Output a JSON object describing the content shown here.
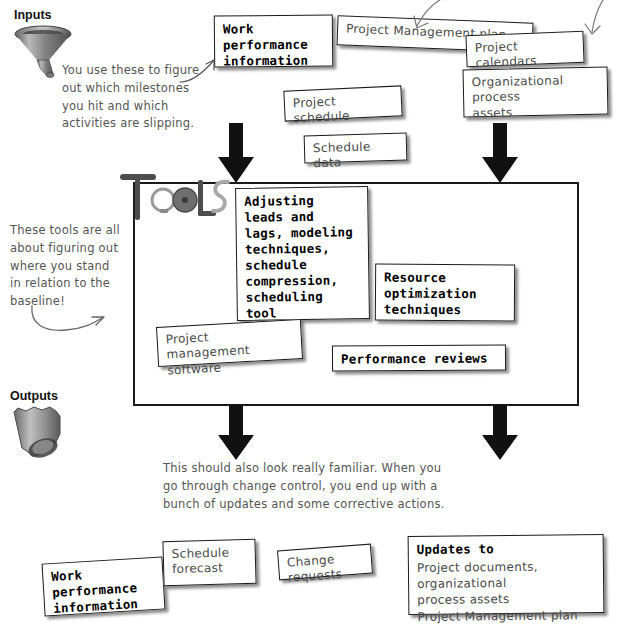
{
  "sections": {
    "inputs_label": "Inputs",
    "outputs_label": "Outputs",
    "tools_wordmark": "Tools"
  },
  "inputs": {
    "note": "You use these to figure\nout which milestones\nyou hit and which\nactivities are slipping.",
    "boxes": [
      {
        "text": "Work\nperformance\ninformation",
        "style": "mono"
      },
      {
        "text": "Project Management plan",
        "style": "hand"
      },
      {
        "text": "Project calendars",
        "style": "hand"
      },
      {
        "text": "Organizational process\nassets",
        "style": "hand"
      },
      {
        "text": "Project schedule",
        "style": "hand"
      },
      {
        "text": "Schedule data",
        "style": "hand"
      }
    ]
  },
  "tools": {
    "note": "These tools are all\nabout figuring out\nwhere you stand\nin relation to the\nbaseline!",
    "boxes": [
      {
        "text": "Adjusting\nleads and\nlags, modeling\ntechniques,\nschedule\ncompression,\nscheduling tool",
        "style": "mono"
      },
      {
        "text": "Resource\noptimization\ntechniques",
        "style": "mono"
      },
      {
        "text": "Project management\nsoftware",
        "style": "hand"
      },
      {
        "text": "Performance reviews",
        "style": "mono"
      }
    ]
  },
  "outputs": {
    "note": "This should also look really familiar. When you\ngo through change control, you end up with a\nbunch of updates and some corrective actions.",
    "boxes": [
      {
        "text": "Work\nperformance\ninformation",
        "style": "mono"
      },
      {
        "text": "Schedule\nforecast",
        "style": "hand"
      },
      {
        "text": "Change requests",
        "style": "hand"
      },
      {
        "text": "Updates to",
        "style": "mono"
      },
      {
        "text": "Project documents, organizational\nprocess assets\nProject Management plan",
        "style": "hand"
      }
    ]
  },
  "icons": {
    "funnel": "funnel-icon",
    "bucket": "bucket-icon",
    "arrow_down": "arrow-down-icon",
    "curved_arrow": "curved-arrow-icon",
    "pointer_arrow": "pointer-arrow-icon"
  },
  "colors": {
    "ink": "#1a1a1a",
    "handwriting": "#555555",
    "paper": "#ffffff",
    "shadow": "rgba(0,0,0,0.45)"
  }
}
